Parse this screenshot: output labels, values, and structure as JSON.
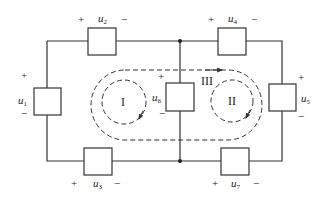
{
  "diagram": {
    "type": "circuit",
    "colors": {
      "wire": "#333333",
      "dash": "#333333",
      "background": "#ffffff"
    },
    "elements": [
      {
        "id": "u1",
        "symbol": "u",
        "subscript": "1",
        "plus": "+",
        "minus": "−",
        "position": "left"
      },
      {
        "id": "u2",
        "symbol": "u",
        "subscript": "2",
        "plus": "+",
        "minus": "−",
        "position": "top-left"
      },
      {
        "id": "u3",
        "symbol": "u",
        "subscript": "3",
        "plus": "+",
        "minus": "−",
        "position": "bottom-left"
      },
      {
        "id": "u4",
        "symbol": "u",
        "subscript": "4",
        "plus": "+",
        "minus": "−",
        "position": "top-right"
      },
      {
        "id": "u5",
        "symbol": "u",
        "subscript": "5",
        "plus": "+",
        "minus": "−",
        "position": "right"
      },
      {
        "id": "u6",
        "symbol": "u",
        "subscript": "6",
        "plus": "+",
        "minus": "−",
        "position": "center"
      },
      {
        "id": "u7",
        "symbol": "u",
        "subscript": "7",
        "plus": "+",
        "minus": "−",
        "position": "bottom-right"
      }
    ],
    "loops": [
      {
        "id": "I",
        "label": "I",
        "direction": "clockwise"
      },
      {
        "id": "II",
        "label": "II",
        "direction": "clockwise"
      },
      {
        "id": "III",
        "label": "III",
        "direction": "clockwise"
      }
    ]
  }
}
